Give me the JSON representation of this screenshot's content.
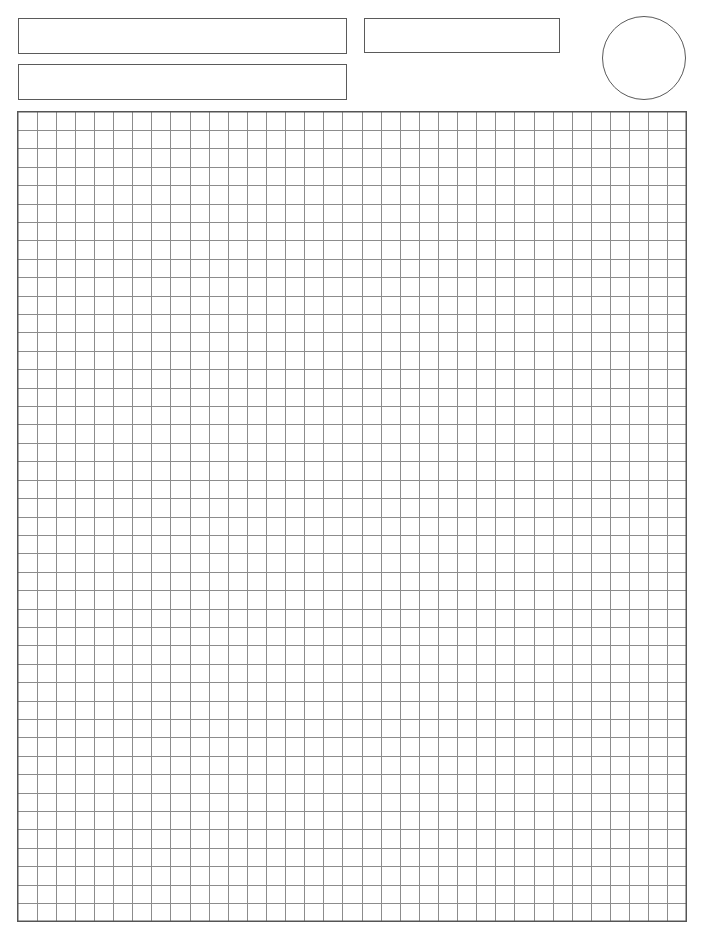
{
  "page": {
    "type": "graph-paper-worksheet",
    "background": "#ffffff"
  },
  "header": {
    "fields": [
      {
        "id": "field-1",
        "value": "",
        "placeholder": ""
      },
      {
        "id": "field-2",
        "value": "",
        "placeholder": ""
      },
      {
        "id": "field-3",
        "value": "",
        "placeholder": ""
      }
    ],
    "score_circle": {
      "value": ""
    }
  },
  "grid": {
    "columns": 35,
    "rows": 44,
    "line_color": "#8c8c8c",
    "border_color": "#555555",
    "width_px": 669,
    "height_px": 810
  },
  "colors": {
    "box_border": "#5a5a5a",
    "grid_line": "#8c8c8c",
    "grid_border": "#555555"
  }
}
